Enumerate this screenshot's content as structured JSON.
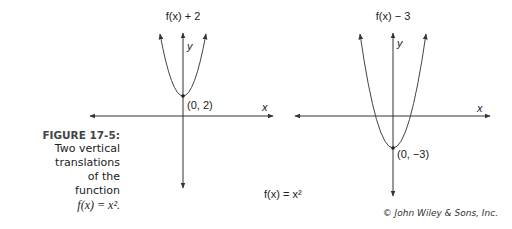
{
  "caption": {
    "label": "FIGURE 17-5:",
    "lines": [
      "Two vertical",
      "translations",
      "of the",
      "function"
    ],
    "function": "f(x) = x²."
  },
  "graphs": {
    "left": {
      "title": "f(x) + 2",
      "vertex_label": "(0, 2)",
      "x_label": "x",
      "y_label": "y"
    },
    "right": {
      "title": "f(x) − 3",
      "vertex_label": "(0, −3)",
      "x_label": "x",
      "y_label": "y"
    }
  },
  "base_function": "f(x) = x²",
  "credit": "© John Wiley & Sons, Inc.",
  "colors": {
    "line": "#333333",
    "text": "#222222"
  }
}
